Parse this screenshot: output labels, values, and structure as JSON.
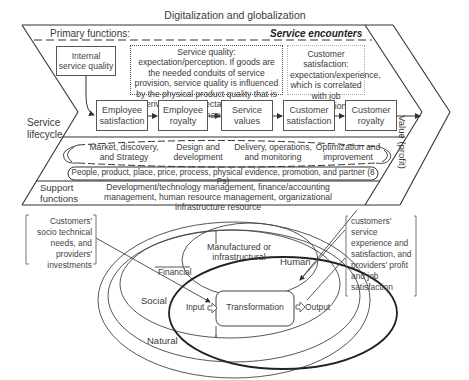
{
  "title": "Digitalization and globalization",
  "primary": {
    "label": "Primary functions:",
    "encounters": "Service encounters",
    "internal_quality": "Internal service quality",
    "service_quality_note": "Service quality: expectation/perception. If goods are the needed conduits of service provision, service quality is influenced by the physical product quality that is derived from expectation/technical performance.",
    "customer_satisfaction_note": "Customer satisfaction: expectation/experience, which is correlated with job satisfaction.",
    "chain": [
      {
        "label": "Employee satisfaction"
      },
      {
        "label": "Employee royalty"
      },
      {
        "label": "Service values"
      },
      {
        "label": "Customer satisfaction"
      },
      {
        "label": "Customer royalty"
      }
    ],
    "value_label": "Value (profit)"
  },
  "lifecycle": {
    "label": "Service lifecycle",
    "stages": [
      {
        "label": "Market, discovery, and Strategy"
      },
      {
        "label": "Design and development"
      },
      {
        "label": "Delivery, operations, and monitoring"
      },
      {
        "label": "Optimization and improvement"
      }
    ],
    "ps": "People, product, place, price, process, physical evidence, promotion, and partner (8 Ps)"
  },
  "support": {
    "label": "Support functions",
    "text": "Development/technology management, finance/accounting management, human resource management, organizational infrastructure resource"
  },
  "capitals": {
    "left_note": "Customers' socio technical needs, and providers' investments",
    "right_note": "customers' service experience and satisfaction, and providers' profit and job satisfaction",
    "manufactured": "Manufactured or infrastructural",
    "financial": "Financial",
    "human": "Human",
    "social": "Social",
    "natural": "Natural",
    "input": "Input",
    "transformation": "Transformation",
    "output": "Output"
  }
}
